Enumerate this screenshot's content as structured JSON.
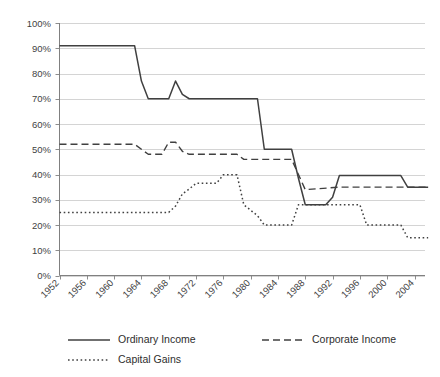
{
  "chart_data": {
    "type": "line",
    "title": "",
    "subtitle": "",
    "xlabel": "",
    "ylabel": "",
    "xlim": [
      1952,
      2006
    ],
    "ylim": [
      0,
      100
    ],
    "grid": true,
    "legend_position": "bottom",
    "y_ticks": [
      "0%",
      "10%",
      "20%",
      "30%",
      "40%",
      "50%",
      "60%",
      "70%",
      "80%",
      "90%",
      "100%"
    ],
    "y_tick_values": [
      0,
      10,
      20,
      30,
      40,
      50,
      60,
      70,
      80,
      90,
      100
    ],
    "x_ticks": [
      "1952",
      "1956",
      "1960",
      "1964",
      "1968",
      "1972",
      "1976",
      "1980",
      "1984",
      "1988",
      "1992",
      "1996",
      "2000",
      "2004"
    ],
    "x_tick_values": [
      1952,
      1956,
      1960,
      1964,
      1968,
      1972,
      1976,
      1980,
      1984,
      1988,
      1992,
      1996,
      2000,
      2004
    ],
    "series": [
      {
        "name": "Ordinary Income",
        "style": "solid",
        "color": "#404040",
        "x": [
          1952,
          1963,
          1964,
          1965,
          1968,
          1969,
          1970,
          1971,
          1981,
          1982,
          1986,
          1987,
          1988,
          1991,
          1992,
          1993,
          2002,
          2003,
          2006
        ],
        "values": [
          91,
          91,
          77,
          70,
          70,
          77,
          71.75,
          70,
          70,
          50,
          50,
          38.5,
          28,
          28,
          31,
          39.6,
          39.6,
          35,
          35
        ]
      },
      {
        "name": "Corporate Income",
        "style": "dashed",
        "color": "#404040",
        "x": [
          1952,
          1963,
          1964,
          1965,
          1967,
          1968,
          1969,
          1970,
          1971,
          1978,
          1979,
          1986,
          1987,
          1988,
          1993,
          2006
        ],
        "values": [
          52,
          52,
          50,
          48,
          48,
          52.8,
          52.8,
          49.2,
          48,
          48,
          46,
          46,
          40,
          34,
          35,
          35
        ]
      },
      {
        "name": "Capital Gains",
        "style": "dotted",
        "color": "#404040",
        "x": [
          1952,
          1967,
          1968,
          1969,
          1970,
          1971,
          1972,
          1975,
          1976,
          1978,
          1979,
          1981,
          1982,
          1986,
          1987,
          1988,
          1996,
          1997,
          2002,
          2003,
          2006
        ],
        "values": [
          25,
          25,
          25,
          27.5,
          32.3,
          34.25,
          36.5,
          36.5,
          39.875,
          39.875,
          28,
          23.7,
          20,
          20,
          28,
          28,
          28,
          20,
          20,
          15,
          15
        ]
      }
    ],
    "legend": [
      {
        "label": "Ordinary Income",
        "style": "solid"
      },
      {
        "label": "Corporate Income",
        "style": "dashed"
      },
      {
        "label": "Capital Gains",
        "style": "dotted"
      }
    ]
  }
}
